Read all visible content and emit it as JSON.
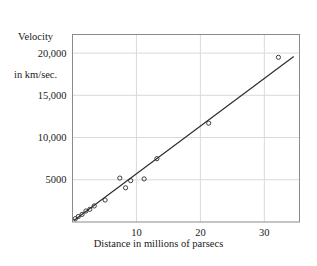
{
  "chart_data": {
    "type": "scatter",
    "title": "",
    "xlabel": "Distance in millions of parsecs",
    "ylabel_line1": "Velocity",
    "ylabel_line2": "in km/sec.",
    "xlim": [
      0,
      35.5
    ],
    "ylim": [
      0,
      22200
    ],
    "grid": true,
    "legend": "none",
    "xticks": [
      10,
      20,
      30
    ],
    "xtick_labels": [
      "10",
      "20",
      "30"
    ],
    "yticks": [
      5000,
      10000,
      15000,
      20000
    ],
    "ytick_labels": [
      "5000",
      "10,000",
      "15,000",
      "20,000"
    ],
    "marker": "open-circle",
    "marker_color": "#2b2b2b",
    "line_color": "#2b2b2b",
    "frame_color": "#8a8a8a",
    "grid_color": "#d9d9d9",
    "points": [
      {
        "x": 0.45,
        "y": 400
      },
      {
        "x": 0.9,
        "y": 650
      },
      {
        "x": 1.5,
        "y": 900
      },
      {
        "x": 2.1,
        "y": 1300
      },
      {
        "x": 2.7,
        "y": 1500
      },
      {
        "x": 3.4,
        "y": 1900
      },
      {
        "x": 5.1,
        "y": 2600
      },
      {
        "x": 7.4,
        "y": 5200
      },
      {
        "x": 8.3,
        "y": 4050
      },
      {
        "x": 9.1,
        "y": 4900
      },
      {
        "x": 11.2,
        "y": 5100
      },
      {
        "x": 13.2,
        "y": 7500
      },
      {
        "x": 21.3,
        "y": 11700
      },
      {
        "x": 32.2,
        "y": 19500
      }
    ],
    "fit_line": {
      "x_start": 0.2,
      "y_start": 180,
      "x_end": 34.6,
      "y_end": 19600
    }
  }
}
